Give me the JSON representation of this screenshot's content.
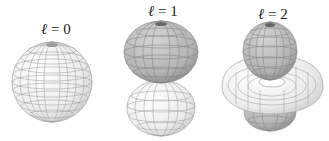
{
  "figure": {
    "panels": [
      {
        "label_var": "ℓ",
        "label_eq": " = 0",
        "shape": "sphere"
      },
      {
        "label_var": "ℓ",
        "label_eq": " = 1",
        "shape": "two-lobes (dumbbell)"
      },
      {
        "label_var": "ℓ",
        "label_eq": " = 2",
        "shape": "two-lobes with torus"
      }
    ],
    "colors": {
      "dark_lobe": "#b8b8b8",
      "light_lobe": "#f2f2f2",
      "grid": "#8a8a8a"
    }
  }
}
